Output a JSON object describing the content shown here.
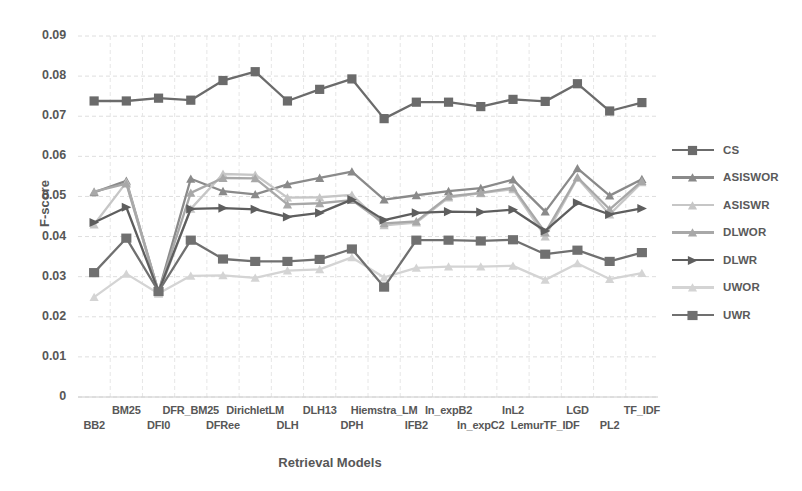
{
  "chart_data": {
    "type": "line",
    "title": "",
    "xlabel": "Retrieval Models",
    "ylabel": "F-score",
    "ylim": [
      0,
      0.09
    ],
    "y_ticks": [
      "0",
      "0.01",
      "0.02",
      "0.03",
      "0.04",
      "0.05",
      "0.06",
      "0.07",
      "0.08",
      "0.09"
    ],
    "grid": true,
    "legend_position": "right",
    "categories": [
      "BB2",
      "BM25",
      "DFI0",
      "DFR_BM25",
      "DFRee",
      "DirichletLM",
      "DLH",
      "DLH13",
      "DPH",
      "Hiemstra_LM",
      "IFB2",
      "In_expB2",
      "In_expC2",
      "InL2",
      "LemurTF_IDF",
      "LGD",
      "PL2",
      "TF_IDF"
    ],
    "series": [
      {
        "name": "CS",
        "color": "#6b6b6b",
        "marker": "square",
        "values": [
          0.0738,
          0.0738,
          0.0745,
          0.074,
          0.0789,
          0.0811,
          0.0738,
          0.0767,
          0.0793,
          0.0694,
          0.0735,
          0.0735,
          0.0724,
          0.0742,
          0.0737,
          0.0781,
          0.0713,
          0.0734
        ]
      },
      {
        "name": "ASISWOR",
        "color": "#8a8a8a",
        "marker": "triangle",
        "values": [
          0.051,
          0.0539,
          0.0262,
          0.0544,
          0.0513,
          0.0505,
          0.053,
          0.0546,
          0.0562,
          0.0492,
          0.0503,
          0.0513,
          0.0521,
          0.0542,
          0.0462,
          0.057,
          0.0502,
          0.0543
        ]
      },
      {
        "name": "ASISWR",
        "color": "#c6c6c6",
        "marker": "triangle",
        "values": [
          0.043,
          0.0535,
          0.0258,
          0.0469,
          0.0556,
          0.0554,
          0.0497,
          0.0498,
          0.0504,
          0.0428,
          0.0435,
          0.0497,
          0.0508,
          0.0518,
          0.04,
          0.0546,
          0.0455,
          0.0535
        ]
      },
      {
        "name": "DLWOR",
        "color": "#a8a8a8",
        "marker": "triangle",
        "values": [
          0.0512,
          0.0532,
          0.0262,
          0.0509,
          0.0546,
          0.0545,
          0.048,
          0.0483,
          0.0491,
          0.0433,
          0.0438,
          0.05,
          0.0509,
          0.0522,
          0.041,
          0.0548,
          0.0468,
          0.0538
        ]
      },
      {
        "name": "DLWR",
        "color": "#5e5e5e",
        "marker": "arrow",
        "values": [
          0.0435,
          0.0473,
          0.0263,
          0.0469,
          0.0471,
          0.0468,
          0.0449,
          0.0459,
          0.0492,
          0.0441,
          0.0459,
          0.0462,
          0.0461,
          0.0467,
          0.0414,
          0.0484,
          0.0455,
          0.047
        ]
      },
      {
        "name": "UWOR",
        "color": "#d4d4d4",
        "marker": "triangle",
        "values": [
          0.0249,
          0.0307,
          0.0258,
          0.0302,
          0.0303,
          0.0297,
          0.0315,
          0.0318,
          0.0348,
          0.0298,
          0.0322,
          0.0325,
          0.0325,
          0.0327,
          0.0292,
          0.0333,
          0.0294,
          0.0309
        ]
      },
      {
        "name": "UWR",
        "color": "#707070",
        "marker": "bowtie",
        "values": [
          0.031,
          0.0396,
          0.0263,
          0.0391,
          0.0344,
          0.0338,
          0.0338,
          0.0343,
          0.0369,
          0.0274,
          0.0391,
          0.0391,
          0.0389,
          0.0392,
          0.0356,
          0.0366,
          0.0338,
          0.036
        ]
      }
    ]
  },
  "axis": {
    "y_title": "F-score",
    "x_title": "Retrieval Models"
  }
}
